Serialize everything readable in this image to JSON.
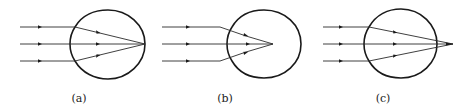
{
  "figure": {
    "panels": [
      {
        "id": "a",
        "label": "(a)",
        "focus": "on retina",
        "rays_count": 3
      },
      {
        "id": "b",
        "label": "(b)",
        "focus": "in front of retina",
        "rays_count": 3
      },
      {
        "id": "c",
        "label": "(c)",
        "focus": "behind retina",
        "rays_count": 3
      }
    ],
    "colors": {
      "stroke": "#1a1a1a",
      "background": "#ffffff"
    }
  }
}
